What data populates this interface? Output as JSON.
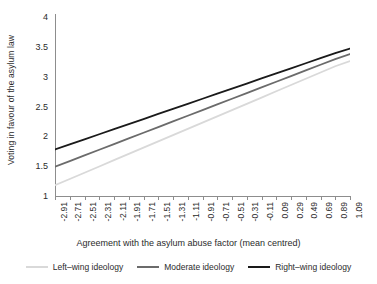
{
  "chart_data": {
    "type": "line",
    "title": "",
    "xlabel": "Agreement with the asylum abuse factor (mean centred)",
    "ylabel": "Voting in favour of the asylum law",
    "xlim": [
      -2.91,
      1.09
    ],
    "ylim": [
      1,
      4
    ],
    "grid": false,
    "legend_position": "bottom",
    "x_tick_labels": [
      "-2.91",
      "-2.71",
      "-2.51",
      "-2.31",
      "-2.11",
      "-1.91",
      "-1.71",
      "-1.51",
      "-1.31",
      "-1.11",
      "-0.91",
      "-0.71",
      "-0.51",
      "-0.31",
      "-0.11",
      "0.09",
      "0.29",
      "0.49",
      "0.69",
      "0.89",
      "1.09"
    ],
    "x": [
      -2.91,
      -2.71,
      -2.51,
      -2.31,
      -2.11,
      -1.91,
      -1.71,
      -1.51,
      -1.31,
      -1.11,
      -0.91,
      -0.71,
      -0.51,
      -0.31,
      -0.11,
      0.09,
      0.29,
      0.49,
      0.69,
      0.89,
      1.09
    ],
    "y_tick_labels": [
      "1",
      "1.5",
      "2",
      "2.5",
      "3",
      "3.5",
      "4"
    ],
    "y_ticks": [
      1,
      1.5,
      2,
      2.5,
      3,
      3.5,
      4
    ],
    "series": [
      {
        "name": "Left-wing ideology",
        "color": "#d9d9d9",
        "values": [
          1.18,
          1.285,
          1.39,
          1.495,
          1.6,
          1.705,
          1.81,
          1.915,
          2.02,
          2.125,
          2.23,
          2.335,
          2.44,
          2.545,
          2.65,
          2.755,
          2.86,
          2.965,
          3.07,
          3.175,
          3.26
        ]
      },
      {
        "name": "Moderate ideology",
        "color": "#6b6b6b",
        "values": [
          1.49,
          1.585,
          1.68,
          1.775,
          1.87,
          1.965,
          2.06,
          2.155,
          2.25,
          2.345,
          2.44,
          2.535,
          2.63,
          2.725,
          2.82,
          2.915,
          3.01,
          3.105,
          3.2,
          3.295,
          3.38
        ]
      },
      {
        "name": "Right-wing ideology",
        "color": "#1a1a1a",
        "values": [
          1.78,
          1.865,
          1.95,
          2.035,
          2.12,
          2.205,
          2.29,
          2.375,
          2.46,
          2.545,
          2.63,
          2.715,
          2.8,
          2.885,
          2.97,
          3.055,
          3.14,
          3.225,
          3.31,
          3.395,
          3.47
        ]
      }
    ],
    "legend": [
      {
        "label": "Left–wing ideology",
        "color": "#d9d9d9"
      },
      {
        "label": "Moderate ideology",
        "color": "#6b6b6b"
      },
      {
        "label": "Right–wing ideology",
        "color": "#1a1a1a"
      }
    ],
    "axis_color": "#8d8d8d",
    "text_color": "#2b2b2b"
  }
}
